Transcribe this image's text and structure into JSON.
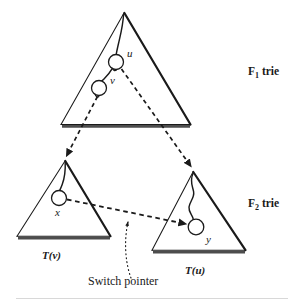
{
  "figure": {
    "background_color": "#ffffff",
    "stroke_color": "#1a1a1a",
    "base_shadow_color": "#4d4d4d"
  },
  "labels": {
    "f1_trie": "F",
    "f1_trie_sub": "1",
    "f1_trie_tail": " trie",
    "f2_trie": "F",
    "f2_trie_sub": "2",
    "f2_trie_tail": " trie",
    "node_u": "u",
    "node_v": "v",
    "node_x": "x",
    "node_y": "y",
    "t_v": "T(v)",
    "t_u": "T(u)",
    "switch_pointer": "Switch pointer"
  },
  "diagram_data": {
    "type": "diagram",
    "triangles": [
      {
        "name": "f1-trie-triangle",
        "label": "F1 trie",
        "apex": [
          124,
          13
        ],
        "base_left": [
          61,
          124
        ],
        "base_right": [
          190,
          124
        ]
      },
      {
        "name": "t-v-triangle",
        "label": "T(v)",
        "apex": [
          65,
          161
        ],
        "base_left": [
          17,
          236
        ],
        "base_right": [
          110,
          236
        ]
      },
      {
        "name": "t-u-triangle",
        "label": "T(u)",
        "apex": [
          193,
          172
        ],
        "base_left": [
          152,
          250
        ],
        "base_right": [
          245,
          250
        ]
      }
    ],
    "nodes": [
      {
        "name": "node-u",
        "label": "u",
        "cx": 116,
        "cy": 62,
        "r": 7.5,
        "label_pos": [
          129,
          53
        ]
      },
      {
        "name": "node-v",
        "label": "v",
        "cx": 99,
        "cy": 88,
        "r": 7.5,
        "label_pos": [
          112,
          80
        ]
      },
      {
        "name": "node-x",
        "label": "x",
        "cx": 59,
        "cy": 198,
        "r": 7.5,
        "label_pos": [
          55,
          211
        ]
      },
      {
        "name": "node-y",
        "label": "y",
        "cx": 196,
        "cy": 227,
        "r": 7.5,
        "label_pos": [
          207,
          237
        ]
      }
    ],
    "edges": [
      {
        "name": "dashed-u-to-t-u",
        "style": "dashed",
        "from": "node-u",
        "to": "t-u-triangle-apex"
      },
      {
        "name": "dashed-v-to-t-v",
        "style": "dashed",
        "from": "node-v",
        "to": "t-v-triangle-apex"
      },
      {
        "name": "dashed-x-to-y",
        "style": "dashed",
        "from": "node-x",
        "to": "node-y",
        "annotation": "Switch pointer"
      },
      {
        "name": "dotted-switch-pointer-leader",
        "style": "dotted",
        "from": "switch-pointer-label",
        "to": "dashed-x-to-y"
      }
    ]
  }
}
